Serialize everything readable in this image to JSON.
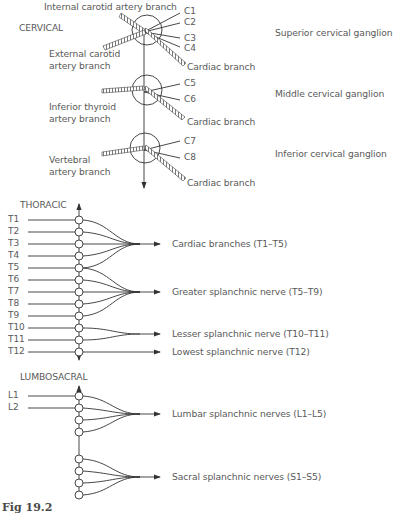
{
  "diagram": {
    "figure_label": "Fig 19.2",
    "sections": {
      "cervical": "CERVICAL",
      "thoracic": "THORACIC",
      "lumbosacral": "LUMBOSACRAL"
    },
    "cervical": {
      "top_label": "Internal carotid artery branch",
      "ganglia": [
        {
          "name": "Superior cervical ganglion",
          "artery_branch": "External carotid artery branch",
          "artery_line1": "External carotid",
          "artery_line2": "artery branch",
          "roots": [
            "C1",
            "C2",
            "C3",
            "C4"
          ],
          "cardiac": "Cardiac branch"
        },
        {
          "name": "Middle cervical ganglion",
          "artery_branch": "Inferior thyroid artery branch",
          "artery_line1": "Inferior thyroid",
          "artery_line2": "artery branch",
          "roots": [
            "C5",
            "C6"
          ],
          "cardiac": "Cardiac branch"
        },
        {
          "name": "Inferior cervical ganglion",
          "artery_branch": "Vertebral artery branch",
          "artery_line1": "Vertebral",
          "artery_line2": "artery branch",
          "roots": [
            "C7",
            "C8"
          ],
          "cardiac": "Cardiac branch"
        }
      ]
    },
    "thoracic": {
      "levels": [
        "T1",
        "T2",
        "T3",
        "T4",
        "T5",
        "T6",
        "T7",
        "T8",
        "T9",
        "T10",
        "T11",
        "T12"
      ],
      "outputs": [
        {
          "label": "Cardiac branches (T1–T5)"
        },
        {
          "label": "Greater splanchnic nerve (T5–T9)"
        },
        {
          "label": "Lesser splanchnic nerve (T10–T11)"
        },
        {
          "label": "Lowest splanchnic nerve (T12)"
        }
      ]
    },
    "lumbosacral": {
      "levels": [
        "L1",
        "L2"
      ],
      "outputs": [
        {
          "label": "Lumbar splanchnic nerves (L1–L5)"
        },
        {
          "label": "Sacral splanchnic nerves (S1–S5)"
        }
      ]
    },
    "colors": {
      "line": "#3a3a3a",
      "text": "#5a5a5a"
    }
  }
}
